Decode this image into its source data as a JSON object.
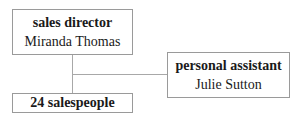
{
  "org_chart": {
    "director": {
      "role": "sales director",
      "name": "Miranda Thomas"
    },
    "assistant": {
      "role": "personal assistant",
      "name": "Julie Sutton"
    },
    "team": {
      "label": "24 salespeople"
    }
  },
  "colors": {
    "border": "#9a9a9a",
    "connector": "#a8a8a8",
    "text": "#1a1a1a"
  }
}
